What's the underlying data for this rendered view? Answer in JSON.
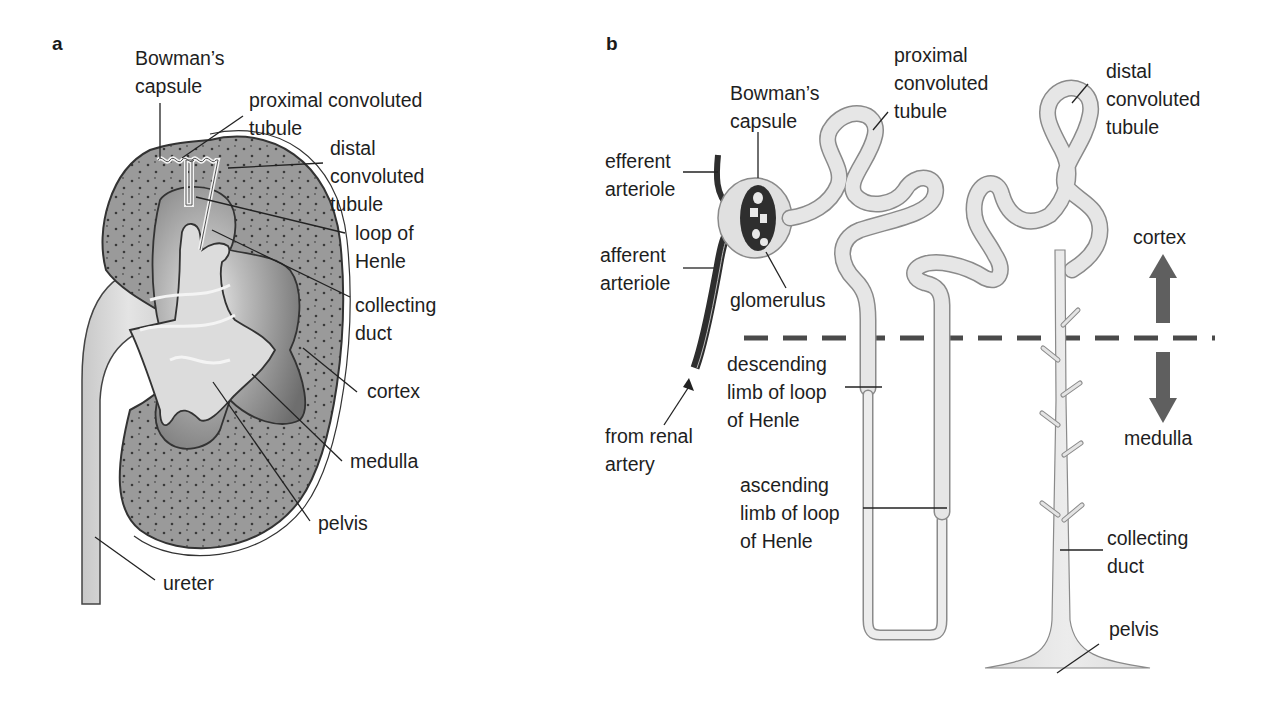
{
  "figure": {
    "panel_a": {
      "letter": "a",
      "title": "Kidney cross-section",
      "labels": {
        "bowmans_capsule": [
          "Bowman’s",
          "capsule"
        ],
        "proximal_convoluted_tubule": [
          "proximal convoluted",
          "tubule"
        ],
        "distal_convoluted_tubule": [
          "distal",
          "convoluted",
          "tubule"
        ],
        "loop_of_henle": [
          "loop of",
          "Henle"
        ],
        "collecting_duct": [
          "collecting",
          "duct"
        ],
        "cortex": [
          "cortex"
        ],
        "medulla": [
          "medulla"
        ],
        "pelvis": [
          "pelvis"
        ],
        "ureter": [
          "ureter"
        ]
      }
    },
    "panel_b": {
      "letter": "b",
      "title": "Nephron structure",
      "labels": {
        "efferent_arteriole": [
          "efferent",
          "arteriole"
        ],
        "bowmans_capsule": [
          "Bowman’s",
          "capsule"
        ],
        "proximal_convoluted_tubule": [
          "proximal",
          "convoluted",
          "tubule"
        ],
        "distal_convoluted_tubule": [
          "distal",
          "convoluted",
          "tubule"
        ],
        "afferent_arteriole": [
          "afferent",
          "arteriole"
        ],
        "glomerulus": [
          "glomerulus"
        ],
        "from_renal_artery": [
          "from renal",
          "artery"
        ],
        "descending_limb": [
          "descending",
          "limb of loop",
          "of Henle"
        ],
        "ascending_limb": [
          "ascending",
          "limb of loop",
          "of Henle"
        ],
        "collecting_duct": [
          "collecting",
          "duct"
        ],
        "pelvis": [
          "pelvis"
        ],
        "cortex": [
          "cortex"
        ],
        "medulla": [
          "medulla"
        ]
      },
      "region_divider": "dashed line separating cortex (above) and medulla (below)"
    },
    "colors": {
      "cortex_fill": "#9a9a9a",
      "medulla_fill": "#7f7f7f",
      "pelvis_fill": "#d4d4d4",
      "tubule_fill": "#e6e6e6",
      "vessel_fill": "#2e2e2e",
      "arrow_fill": "#5f5f5f",
      "outline": "#333333",
      "text": "#1e1e1e"
    }
  }
}
